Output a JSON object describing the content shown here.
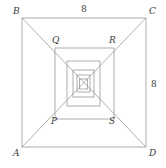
{
  "figure": {
    "stroke_color": "#9a9a9a",
    "label_color": "#3a3a3a",
    "background": "#ffffff",
    "outer_square": {
      "name": "ABCD",
      "vertices": [
        {
          "id": "B",
          "label": "B",
          "x": 22,
          "y": 18
        },
        {
          "id": "C",
          "label": "C",
          "x": 146,
          "y": 18
        },
        {
          "id": "D",
          "label": "D",
          "x": 146,
          "y": 147
        },
        {
          "id": "A",
          "label": "A",
          "x": 22,
          "y": 147
        }
      ]
    },
    "inner_square": {
      "name": "PQRS",
      "vertices": [
        {
          "id": "Q",
          "label": "Q",
          "x": 55,
          "y": 48
        },
        {
          "id": "R",
          "label": "R",
          "x": 114,
          "y": 48
        },
        {
          "id": "S",
          "label": "S",
          "x": 114,
          "y": 119
        },
        {
          "id": "P",
          "label": "P",
          "x": 55,
          "y": 119
        }
      ]
    },
    "nested_squares": [
      {
        "index": 1,
        "x": 22,
        "y": 18,
        "width": 124,
        "height": 129
      },
      {
        "index": 2,
        "x": 55,
        "y": 48,
        "width": 59,
        "height": 71
      },
      {
        "index": 3,
        "x": 67,
        "y": 61,
        "width": 33,
        "height": 45
      },
      {
        "index": 4,
        "x": 73,
        "y": 70,
        "width": 21,
        "height": 27
      },
      {
        "index": 5,
        "x": 77,
        "y": 75,
        "width": 13,
        "height": 17
      },
      {
        "index": 6,
        "x": 79,
        "y": 79,
        "width": 8,
        "height": 10
      }
    ],
    "diagonals": [
      {
        "id": "diagonal-B-D",
        "x1": 22,
        "y1": 18,
        "x2": 146,
        "y2": 147
      },
      {
        "id": "diagonal-C-A",
        "x1": 146,
        "y1": 18,
        "x2": 22,
        "y2": 147
      }
    ],
    "measures": [
      {
        "id": "top-side",
        "label": "8",
        "side": "BC"
      },
      {
        "id": "right-side",
        "label": "8",
        "side": "CD"
      }
    ]
  }
}
